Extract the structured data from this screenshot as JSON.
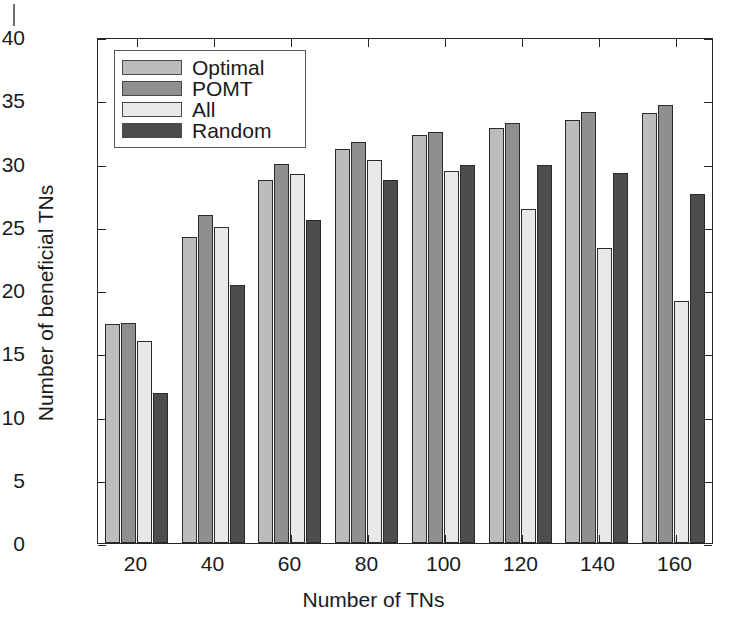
{
  "figure": {
    "background": "#ffffff",
    "axis_color": "#262626"
  },
  "chart_data": {
    "type": "bar",
    "title": "",
    "xlabel": "Number of TNs",
    "ylabel": "Number of beneficial TNs",
    "categories": [
      "20",
      "40",
      "60",
      "80",
      "100",
      "120",
      "140",
      "160"
    ],
    "xtick_labels": [
      "20",
      "40",
      "60",
      "80",
      "100",
      "120",
      "140",
      "160"
    ],
    "ytick_labels": [
      "0",
      "5",
      "10",
      "15",
      "20",
      "25",
      "30",
      "35",
      "40"
    ],
    "ytick_values": [
      0,
      5,
      10,
      15,
      20,
      25,
      30,
      35,
      40
    ],
    "ylim": [
      0,
      40
    ],
    "grid": false,
    "legend_position": "upper-left-inside",
    "series": [
      {
        "name": "Optimal",
        "color": "#bcbcbc",
        "values": [
          17.4,
          24.3,
          28.8,
          31.3,
          32.4,
          32.9,
          33.6,
          34.1
        ]
      },
      {
        "name": "POMT",
        "color": "#8f8f8f",
        "values": [
          17.5,
          26.0,
          30.1,
          31.8,
          32.6,
          33.3,
          34.2,
          34.8
        ]
      },
      {
        "name": "All",
        "color": "#e8e8e8",
        "values": [
          16.0,
          25.1,
          29.3,
          30.4,
          29.5,
          26.5,
          23.4,
          19.2
        ]
      },
      {
        "name": "Random",
        "color": "#4d4d4d",
        "values": [
          11.9,
          20.5,
          25.6,
          28.8,
          30.0,
          30.0,
          29.4,
          27.7
        ]
      }
    ]
  },
  "legend": {
    "items": [
      {
        "label": "Optimal",
        "color": "#bcbcbc"
      },
      {
        "label": "POMT",
        "color": "#8f8f8f"
      },
      {
        "label": "All",
        "color": "#e8e8e8"
      },
      {
        "label": "Random",
        "color": "#4d4d4d"
      }
    ]
  }
}
